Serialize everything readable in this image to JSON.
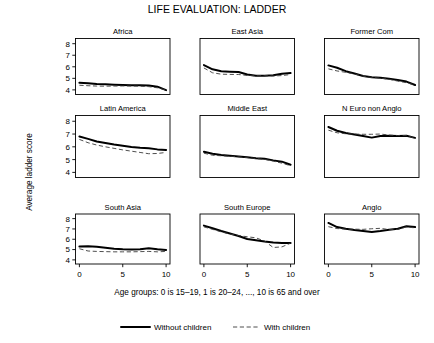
{
  "chart_data": {
    "type": "line",
    "title": "LIFE EVALUATION: LADDER",
    "xlabel": "Age groups: 0 is 15–19, 1 is 20–24, ..., 10 is 65 and over",
    "ylabel": "Average ladder score",
    "xlim": [
      -0.45,
      10.45
    ],
    "ylim": [
      3.6,
      8.45
    ],
    "xticks": [
      0,
      5,
      10
    ],
    "xticklabels": [
      "0",
      "5",
      "10"
    ],
    "yticks": [
      4,
      5,
      6,
      7,
      8
    ],
    "yticklabels": [
      "4",
      "5",
      "6",
      "7",
      "8"
    ],
    "grid": false,
    "legend_position": "bottom-center",
    "legend": [
      {
        "name": "Without children",
        "style": "solid",
        "color": "#000000"
      },
      {
        "name": "With children",
        "style": "dashed",
        "color": "#3b3b3b"
      }
    ],
    "x": [
      0,
      1,
      2,
      3,
      4,
      5,
      6,
      7,
      8,
      9,
      10
    ],
    "panels": [
      {
        "title": "Africa",
        "row": 0,
        "col": 0,
        "series": [
          {
            "name": "Without children",
            "style": "solid",
            "values": [
              4.62,
              4.58,
              4.52,
              4.48,
              4.45,
              4.42,
              4.4,
              4.4,
              4.38,
              4.28,
              3.98
            ]
          },
          {
            "name": "With children",
            "style": "dashed",
            "values": [
              4.4,
              4.36,
              4.33,
              4.32,
              4.33,
              4.34,
              4.33,
              4.32,
              4.28,
              4.18,
              3.98
            ]
          }
        ]
      },
      {
        "title": "East Asia",
        "row": 0,
        "col": 1,
        "series": [
          {
            "name": "Without children",
            "style": "solid",
            "values": [
              6.15,
              5.78,
              5.62,
              5.58,
              5.55,
              5.33,
              5.22,
              5.22,
              5.27,
              5.4,
              5.46
            ]
          },
          {
            "name": "With children",
            "style": "dashed",
            "values": [
              5.9,
              5.48,
              5.36,
              5.34,
              5.33,
              5.25,
              5.22,
              5.23,
              5.2,
              5.24,
              5.33
            ]
          }
        ]
      },
      {
        "title": "Former Com",
        "row": 0,
        "col": 2,
        "series": [
          {
            "name": "Without children",
            "style": "solid",
            "values": [
              6.12,
              5.92,
              5.62,
              5.42,
              5.2,
              5.1,
              5.05,
              4.96,
              4.86,
              4.72,
              4.42
            ]
          },
          {
            "name": "With children",
            "style": "dashed",
            "values": [
              5.82,
              5.64,
              5.52,
              5.38,
              5.18,
              5.08,
              5.02,
              4.92,
              4.76,
              4.62,
              4.42
            ]
          }
        ]
      },
      {
        "title": "Latin America",
        "row": 1,
        "col": 0,
        "series": [
          {
            "name": "Without children",
            "style": "solid",
            "values": [
              6.8,
              6.62,
              6.42,
              6.3,
              6.18,
              6.08,
              5.98,
              5.92,
              5.88,
              5.8,
              5.76
            ]
          },
          {
            "name": "With children",
            "style": "dashed",
            "values": [
              6.58,
              6.32,
              6.14,
              6.0,
              5.88,
              5.76,
              5.66,
              5.56,
              5.46,
              5.48,
              5.56
            ]
          }
        ]
      },
      {
        "title": "Middle East",
        "row": 1,
        "col": 1,
        "series": [
          {
            "name": "Without children",
            "style": "solid",
            "values": [
              5.62,
              5.46,
              5.36,
              5.3,
              5.24,
              5.18,
              5.1,
              5.06,
              4.94,
              4.84,
              4.6
            ]
          },
          {
            "name": "With children",
            "style": "dashed",
            "values": [
              5.5,
              5.34,
              5.3,
              5.26,
              5.22,
              5.16,
              5.08,
              5.02,
              4.88,
              4.72,
              4.52
            ]
          }
        ]
      },
      {
        "title": "N Euro non Anglo",
        "row": 1,
        "col": 2,
        "series": [
          {
            "name": "Without children",
            "style": "solid",
            "values": [
              7.55,
              7.26,
              7.08,
              6.96,
              6.84,
              6.72,
              6.84,
              6.86,
              6.84,
              6.86,
              6.7
            ]
          },
          {
            "name": "With children",
            "style": "dashed",
            "values": [
              7.3,
              7.1,
              7.02,
              7.0,
              6.98,
              6.98,
              7.0,
              6.92,
              6.88,
              6.88,
              6.68
            ]
          }
        ]
      },
      {
        "title": "South Asia",
        "row": 2,
        "col": 0,
        "series": [
          {
            "name": "Without children",
            "style": "solid",
            "values": [
              5.3,
              5.32,
              5.28,
              5.18,
              5.08,
              5.02,
              5.0,
              5.02,
              5.12,
              5.02,
              4.96
            ]
          },
          {
            "name": "With children",
            "style": "dashed",
            "values": [
              5.08,
              4.86,
              4.82,
              4.8,
              4.78,
              4.78,
              4.78,
              4.8,
              4.82,
              4.78,
              4.82
            ]
          }
        ]
      },
      {
        "title": "South Europe",
        "row": 2,
        "col": 1,
        "series": [
          {
            "name": "Without children",
            "style": "solid",
            "values": [
              7.32,
              7.06,
              6.8,
              6.56,
              6.32,
              6.02,
              5.9,
              5.78,
              5.68,
              5.64,
              5.64
            ]
          },
          {
            "name": "With children",
            "style": "dashed",
            "values": [
              7.2,
              6.96,
              6.72,
              6.5,
              6.36,
              6.24,
              6.14,
              5.82,
              5.2,
              5.26,
              5.62
            ]
          }
        ]
      },
      {
        "title": "Anglo",
        "row": 2,
        "col": 2,
        "series": [
          {
            "name": "Without children",
            "style": "solid",
            "values": [
              7.58,
              7.18,
              7.02,
              6.9,
              6.8,
              6.7,
              6.8,
              6.92,
              7.02,
              7.26,
              7.18
            ]
          },
          {
            "name": "With children",
            "style": "dashed",
            "values": [
              7.22,
              7.04,
              6.98,
              6.98,
              6.96,
              7.02,
              7.06,
              6.94,
              6.96,
              7.2,
              7.1
            ]
          }
        ]
      }
    ]
  }
}
